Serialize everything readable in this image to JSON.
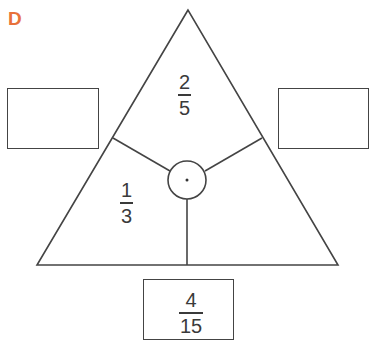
{
  "label": "D",
  "colors": {
    "label": "#e8713a",
    "stroke": "#444444",
    "text": "#3a3a3a"
  },
  "triangle": {
    "top": {
      "numerator": "2",
      "denominator": "5"
    },
    "left": {
      "numerator": "1",
      "denominator": "3"
    },
    "center_symbol": "·"
  },
  "boxes": {
    "left": {
      "value": ""
    },
    "right": {
      "value": ""
    },
    "bottom": {
      "numerator": "4",
      "denominator": "15"
    }
  }
}
